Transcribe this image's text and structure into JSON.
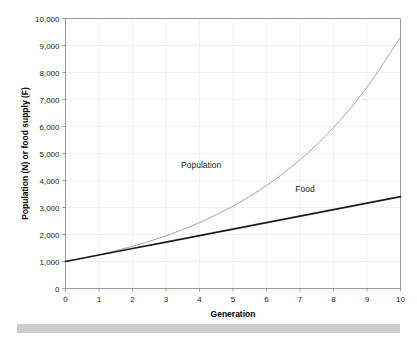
{
  "chart_data": {
    "type": "line",
    "title": "",
    "xlabel": "Generation",
    "ylabel": "Population (N) or food supply (F)",
    "xlim": [
      0,
      10
    ],
    "ylim": [
      0,
      10000
    ],
    "grid": true,
    "legend_position": "inline-annotation",
    "x": [
      0,
      1,
      2,
      3,
      4,
      5,
      6,
      7,
      8,
      9,
      10
    ],
    "xticklabels": [
      "0",
      "1",
      "2",
      "3",
      "4",
      "5",
      "6",
      "7",
      "8",
      "9",
      "10"
    ],
    "yticks": [
      0,
      1000,
      2000,
      3000,
      4000,
      5000,
      6000,
      7000,
      8000,
      9000,
      10000
    ],
    "yticklabels": [
      "0",
      "1,000",
      "2,000",
      "3,000",
      "4,000",
      "5,000",
      "6,000",
      "7,000",
      "8,000",
      "9,000",
      "10,000"
    ],
    "series": [
      {
        "name": "Population",
        "color": "#9a9a9a",
        "width": 0.9,
        "label_x": 4.05,
        "label_y": 4450,
        "values": [
          1000,
          1250,
          1563,
          1953,
          2441,
          3052,
          3815,
          4768,
          5960,
          7451,
          9313
        ]
      },
      {
        "name": "Food",
        "color": "#1a1a1a",
        "width": 1.7,
        "label_x": 7.15,
        "label_y": 3560,
        "values": [
          1000,
          1240,
          1480,
          1720,
          1960,
          2200,
          2440,
          2680,
          2920,
          3160,
          3400
        ]
      }
    ]
  },
  "annotations": {
    "population_label": "Population",
    "food_label": "Food"
  },
  "axes": {
    "x_title": "Generation",
    "y_title": "Population (N) or food supply (F)"
  },
  "colors": {
    "population_line": "#9a9a9a",
    "food_line": "#1a1a1a",
    "grid": "#e9e9e9",
    "axis": "#8d8d8d",
    "background": "#ffffff",
    "bottom_band": "#cdcdcd"
  }
}
